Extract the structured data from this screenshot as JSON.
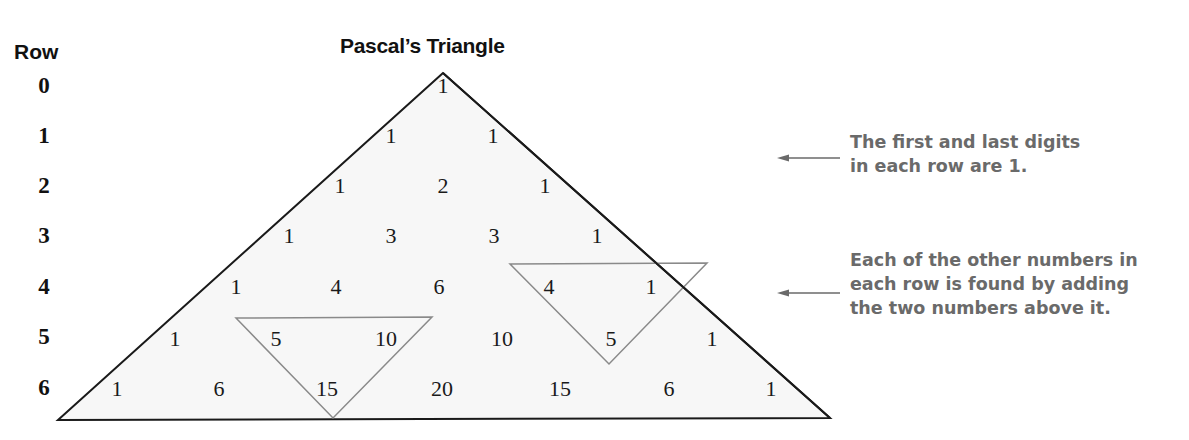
{
  "header": {
    "row_label": "Row",
    "title": "Pascal’s Triangle"
  },
  "rows": [
    {
      "label": "0",
      "y": 86,
      "values": [
        "1"
      ]
    },
    {
      "label": "1",
      "y": 136,
      "values": [
        "1",
        "1"
      ]
    },
    {
      "label": "2",
      "y": 186,
      "values": [
        "1",
        "2",
        "1"
      ]
    },
    {
      "label": "3",
      "y": 236,
      "values": [
        "1",
        "3",
        "3",
        "1"
      ]
    },
    {
      "label": "4",
      "y": 287,
      "values": [
        "1",
        "4",
        "6",
        "4",
        "1"
      ]
    },
    {
      "label": "5",
      "y": 337,
      "values": [
        "1",
        "5",
        "10",
        "10",
        "5",
        "1"
      ]
    },
    {
      "label": "6",
      "y": 388,
      "values": [
        "1",
        "6",
        "15",
        "20",
        "15",
        "6",
        "1"
      ]
    }
  ],
  "annotations": {
    "edge_rule": {
      "lines": [
        "The first and last digits",
        "in each row are 1."
      ],
      "arrow_direction": "left"
    },
    "sum_rule": {
      "lines": [
        "Each of the other numbers in",
        "each row is found by adding",
        "the two numbers above it."
      ],
      "arrow_direction": "left"
    }
  },
  "highlights": [
    {
      "description": "5 + 10 = 15",
      "cells": [
        "5",
        "10",
        "15"
      ]
    },
    {
      "description": "4 + 1 = 5",
      "cells": [
        "4",
        "1",
        "5"
      ]
    }
  ],
  "colors": {
    "triangle_fill": "#f7f7f7",
    "triangle_stroke": "#1a1a1a",
    "highlight_stroke": "#8a8a8a",
    "annotation_text": "#6a6a6a",
    "arrow": "#6a6a6a"
  }
}
